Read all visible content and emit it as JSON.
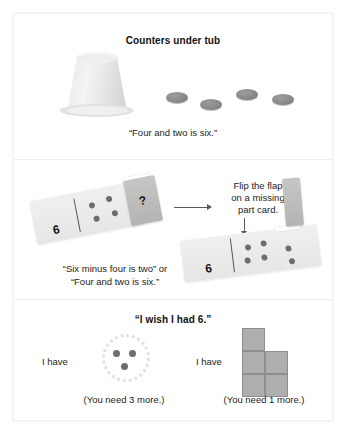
{
  "worksheet": {
    "panels": [
      {
        "id": "counters-under-tub",
        "title": "Counters under tub",
        "caption": "“Four and two is six.”",
        "counters_visible": 4,
        "counters_hidden": 2,
        "total": 6
      },
      {
        "id": "missing-part-card",
        "instruction_lines": [
          "Flip the flap",
          "on a missing",
          "part card."
        ],
        "left_card": {
          "number": "6",
          "dots": 4,
          "flap_label": "?"
        },
        "right_card": {
          "number": "6",
          "dots_left": 4,
          "dots_revealed": 2
        },
        "caption_line1": "“Six minus four is two” or",
        "caption_line2": "“Four and two is six.”"
      },
      {
        "id": "i-wish-i-had-6",
        "title": "“I wish I had 6.”",
        "left": {
          "have_label": "I have",
          "count": 3,
          "note": "(You need 3 more.)"
        },
        "right": {
          "have_label": "I have",
          "count": 5,
          "note": "(You need 1 more.)"
        }
      }
    ]
  },
  "colors": {
    "page_background": "#ffffff",
    "frame_border": "#f2f2f2",
    "panel_divider": "#ededed",
    "counter_gray": "#8a8a8a",
    "dot_gray": "#6d6d6d",
    "card_gray": "#eceeec",
    "flap_gray": "#bcbcba",
    "block_gray": "#aeaeae",
    "block_border": "#8e8e8e",
    "text": "#1d1d1d",
    "arrow": "#5a5a5a"
  }
}
